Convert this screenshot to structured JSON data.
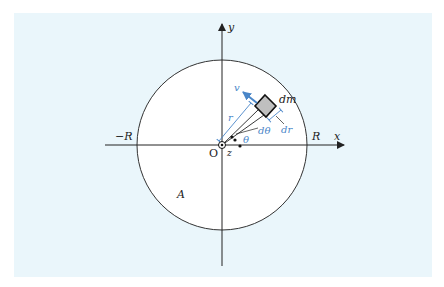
{
  "diagram": {
    "type": "rotating-disk-mass-element",
    "colors": {
      "background": "#eaf6fb",
      "disk_fill": "#ffffff",
      "lines": "#222222",
      "accent_blue": "#4a86c8",
      "element_fill": "#bfbfbf"
    },
    "labels": {
      "y_axis": "y",
      "x_axis": "x",
      "origin": "O",
      "z_axis": "z",
      "neg_radius": "−R",
      "pos_radius": "R",
      "area": "A",
      "radius": "r",
      "velocity": "v",
      "mass_element": "dm",
      "angle": "θ",
      "d_angle": "dθ",
      "d_radius": "dr"
    }
  }
}
